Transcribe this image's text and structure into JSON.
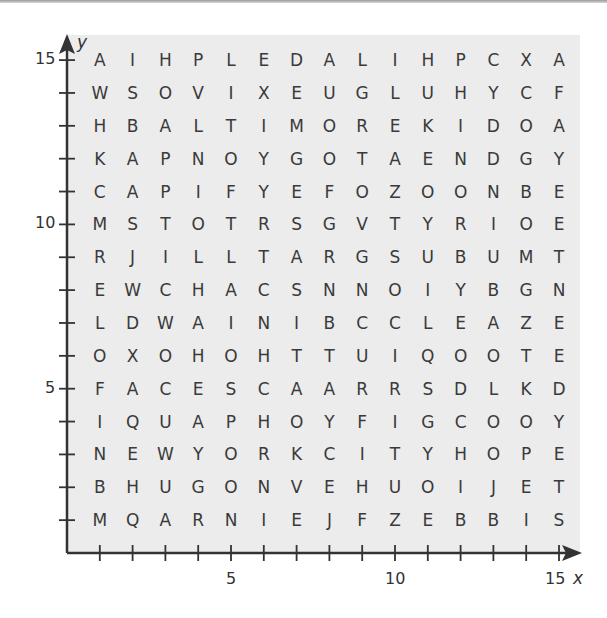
{
  "axes": {
    "x_label": "x",
    "y_label": "y",
    "x_ticks": [
      {
        "value": 5,
        "label": "5"
      },
      {
        "value": 10,
        "label": "10"
      },
      {
        "value": 15,
        "label": "15"
      }
    ],
    "y_ticks": [
      {
        "value": 5,
        "label": "5"
      },
      {
        "value": 10,
        "label": "10"
      },
      {
        "value": 15,
        "label": "15"
      }
    ],
    "range": {
      "x": [
        0,
        15
      ],
      "y": [
        0,
        15
      ]
    }
  },
  "grid": {
    "rows_top_to_bottom": [
      {
        "y": 15,
        "letters": "AIHPLEDALIHPCXA"
      },
      {
        "y": 14,
        "letters": "WSOVIXEUGLUHYCF"
      },
      {
        "y": 13,
        "letters": "HBALTIMOREKIDOA"
      },
      {
        "y": 12,
        "letters": "KAPNOYGOTAENDGY"
      },
      {
        "y": 11,
        "letters": "CAPIFYEFOZOONBE"
      },
      {
        "y": 10,
        "letters": "MSTOTRSGVTYRIOE"
      },
      {
        "y": 9,
        "letters": "RJILLTARGSUBUMT"
      },
      {
        "y": 8,
        "letters": "EWCHACSNNOIYBGN"
      },
      {
        "y": 7,
        "letters": "LDWAINIBCCLEAZE"
      },
      {
        "y": 6,
        "letters": "OXOHOHTTUIQOOTE"
      },
      {
        "y": 5,
        "letters": "FACESCAARRSDLKD"
      },
      {
        "y": 4,
        "letters": "IQUAPHOYFIGCOOY"
      },
      {
        "y": 3,
        "letters": "NEWYORKCITYHOPE"
      },
      {
        "y": 2,
        "letters": "BHUGONVEHUOIJET"
      },
      {
        "y": 1,
        "letters": "MQARNIEJFZEBBIS"
      }
    ]
  },
  "colors": {
    "panel_bg": "#ececec",
    "axis": "#333333",
    "text": "#3a3a3a"
  }
}
